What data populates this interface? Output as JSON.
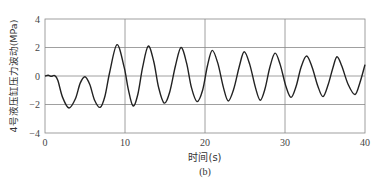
{
  "chart_data": {
    "type": "line",
    "title": "",
    "subtitle": "(b)",
    "xlabel": "时间(s)",
    "ylabel": "4号液压缸压力波动(MPa)",
    "xlim": [
      0,
      40
    ],
    "ylim": [
      -4,
      4
    ],
    "xticks": [
      0,
      10,
      20,
      30,
      40
    ],
    "yticks": [
      4,
      2,
      0,
      -2,
      -4
    ],
    "xtick_labels": [
      "0",
      "10",
      "20",
      "30",
      "40"
    ],
    "ytick_labels": [
      "4",
      "2",
      "0",
      "−2",
      "−4"
    ],
    "grid": true,
    "legend": null,
    "series": [
      {
        "name": "4号液压缸压力波动",
        "color": "#222222",
        "points": [
          [
            0.0,
            0.0
          ],
          [
            0.4,
            0.05
          ],
          [
            0.8,
            -0.02
          ],
          [
            1.2,
            0.03
          ],
          [
            1.6,
            -0.3
          ],
          [
            2.2,
            -1.5
          ],
          [
            3.0,
            -2.25
          ],
          [
            3.8,
            -1.6
          ],
          [
            4.4,
            -0.5
          ],
          [
            5.0,
            -0.05
          ],
          [
            5.6,
            -0.6
          ],
          [
            6.2,
            -1.7
          ],
          [
            6.9,
            -2.2
          ],
          [
            7.5,
            -1.4
          ],
          [
            8.1,
            0.3
          ],
          [
            9.0,
            2.2
          ],
          [
            9.9,
            0.6
          ],
          [
            10.4,
            -0.9
          ],
          [
            11.0,
            -2.1
          ],
          [
            11.6,
            -1.3
          ],
          [
            12.2,
            0.6
          ],
          [
            12.9,
            2.1
          ],
          [
            13.6,
            1.0
          ],
          [
            14.2,
            -0.8
          ],
          [
            14.9,
            -1.9
          ],
          [
            15.6,
            -1.1
          ],
          [
            16.3,
            0.7
          ],
          [
            17.0,
            2.0
          ],
          [
            17.7,
            0.9
          ],
          [
            18.3,
            -0.8
          ],
          [
            19.0,
            -1.8
          ],
          [
            19.7,
            -1.0
          ],
          [
            20.3,
            0.7
          ],
          [
            20.9,
            1.8
          ],
          [
            21.6,
            0.9
          ],
          [
            22.3,
            -0.8
          ],
          [
            22.9,
            -1.75
          ],
          [
            23.6,
            -0.9
          ],
          [
            24.3,
            0.7
          ],
          [
            24.9,
            1.7
          ],
          [
            25.6,
            0.8
          ],
          [
            26.3,
            -0.8
          ],
          [
            26.9,
            -1.7
          ],
          [
            27.5,
            -0.9
          ],
          [
            28.1,
            0.6
          ],
          [
            28.75,
            1.6
          ],
          [
            29.4,
            0.8
          ],
          [
            30.1,
            -0.7
          ],
          [
            30.75,
            -1.5
          ],
          [
            31.4,
            -0.7
          ],
          [
            32.0,
            0.6
          ],
          [
            32.7,
            1.4
          ],
          [
            33.4,
            0.6
          ],
          [
            34.1,
            -0.7
          ],
          [
            34.75,
            -1.45
          ],
          [
            35.4,
            -0.6
          ],
          [
            36.0,
            0.6
          ],
          [
            36.5,
            1.35
          ],
          [
            37.1,
            0.7
          ],
          [
            37.9,
            -0.6
          ],
          [
            38.75,
            -1.3
          ],
          [
            39.4,
            -0.4
          ],
          [
            40.0,
            0.8
          ]
        ]
      }
    ]
  }
}
